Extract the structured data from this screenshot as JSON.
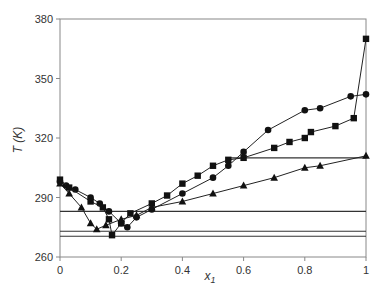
{
  "chart_data": {
    "type": "line",
    "title": "",
    "xlabel": "x1",
    "ylabel": "T (K)",
    "xlim": [
      0,
      1
    ],
    "ylim": [
      260,
      380
    ],
    "xticks": [
      0,
      0.2,
      0.4,
      0.6,
      0.8,
      1
    ],
    "xtick_labels": [
      "0",
      "0.2",
      "0.4",
      "0.6",
      "0.8",
      "1"
    ],
    "yticks": [
      260,
      290,
      320,
      350,
      380
    ],
    "grid": false,
    "legend": null,
    "series": [
      {
        "name": "circles",
        "marker": "circle",
        "x": [
          0,
          0.02,
          0.05,
          0.1,
          0.13,
          0.16,
          0.2,
          0.22,
          0.25,
          0.3,
          0.4,
          0.5,
          0.55,
          0.6,
          0.68,
          0.8,
          0.85,
          0.95,
          1
        ],
        "y": [
          298,
          296,
          294,
          290,
          287,
          283,
          277,
          275,
          280,
          284,
          292,
          300,
          306,
          313,
          324,
          334,
          335,
          341,
          342
        ]
      },
      {
        "name": "squares",
        "marker": "square",
        "x": [
          0,
          0.03,
          0.1,
          0.14,
          0.16,
          0.17,
          0.2,
          0.23,
          0.3,
          0.35,
          0.4,
          0.45,
          0.5,
          0.55,
          0.6,
          0.7,
          0.75,
          0.8,
          0.82,
          0.9,
          0.96,
          1
        ],
        "y": [
          299,
          295,
          288,
          285,
          279,
          271,
          277,
          282,
          287,
          291,
          297,
          301,
          306,
          309,
          310,
          315,
          318,
          320,
          323,
          326,
          330,
          370
        ]
      },
      {
        "name": "triangles",
        "marker": "triangle",
        "x": [
          0,
          0.03,
          0.07,
          0.1,
          0.12,
          0.15,
          0.2,
          0.25,
          0.3,
          0.4,
          0.5,
          0.6,
          0.7,
          0.8,
          0.85,
          1
        ],
        "y": [
          297,
          292,
          285,
          277,
          274,
          276,
          279,
          281,
          285,
          288,
          292,
          296,
          300,
          305,
          306,
          311
        ]
      }
    ],
    "reference_lines": [
      {
        "y": 310,
        "x_from": 0.55,
        "x_to": 1
      },
      {
        "y": 283,
        "x_from": 0,
        "x_to": 1
      },
      {
        "y": 273,
        "x_from": 0,
        "x_to": 1
      },
      {
        "y": 270.5,
        "x_from": 0,
        "x_to": 1
      }
    ]
  },
  "axes": {
    "ylabel": "T (K)",
    "xlabel_main": "x",
    "xlabel_sub": "1"
  }
}
